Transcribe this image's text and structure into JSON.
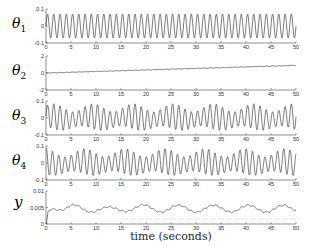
{
  "chart_data": [
    {
      "type": "line",
      "panel": "theta1",
      "ylabel": "θ1",
      "xlim": [
        0,
        50
      ],
      "ylim": [
        -0.1,
        0.1
      ],
      "yticks": [
        "-0.1",
        "0",
        "0.1"
      ],
      "xticks": [
        "0",
        "5",
        "10",
        "15",
        "20",
        "25",
        "30",
        "35",
        "40",
        "45",
        "50"
      ],
      "description": "steady sinusoidal oscillation, ~0.8 Hz, amplitude ~0.07",
      "x": [
        0,
        50
      ],
      "frequency_hz": 0.8,
      "amplitude": 0.07,
      "offset": 0.0
    },
    {
      "type": "line",
      "panel": "theta2",
      "ylabel": "θ2",
      "xlim": [
        0,
        50
      ],
      "ylim": [
        -2,
        2
      ],
      "yticks": [
        "-2",
        "0",
        "2"
      ],
      "xticks": [
        "0",
        "5",
        "10",
        "15",
        "20",
        "25",
        "30",
        "35",
        "40",
        "45",
        "50"
      ],
      "description": "slowly increasing nearly linear drift",
      "x": [
        0,
        10,
        20,
        30,
        40,
        50
      ],
      "y": [
        0.0,
        0.18,
        0.36,
        0.54,
        0.72,
        0.9
      ]
    },
    {
      "type": "line",
      "panel": "theta3",
      "ylabel": "θ3",
      "xlim": [
        0,
        50
      ],
      "ylim": [
        -0.1,
        0.1
      ],
      "yticks": [
        "-0.1",
        "0",
        "0.1"
      ],
      "xticks": [
        "0",
        "5",
        "10",
        "15",
        "20",
        "25",
        "30",
        "35",
        "40",
        "45",
        "50"
      ],
      "description": "oscillation ~0.8 Hz with slow amplitude modulation, amplitude ~0.05-0.07",
      "frequency_hz": 0.8,
      "amplitude": 0.06,
      "modulation_period_s": 8
    },
    {
      "type": "line",
      "panel": "theta4",
      "ylabel": "θ4",
      "xlim": [
        0,
        50
      ],
      "ylim": [
        -0.1,
        0.1
      ],
      "yticks": [
        "-0.1",
        "0",
        "0.1"
      ],
      "xticks": [
        "0",
        "5",
        "10",
        "15",
        "20",
        "25",
        "30",
        "35",
        "40",
        "45",
        "50"
      ],
      "description": "oscillation ~0.8 Hz with slow amplitude/offset modulation, amplitude ~0.05-0.07",
      "frequency_hz": 0.8,
      "amplitude": 0.06,
      "modulation_period_s": 8
    },
    {
      "type": "line",
      "panel": "y",
      "ylabel": "y",
      "xlabel": "time (seconds)",
      "xlim": [
        0,
        50
      ],
      "ylim": [
        0,
        0.01
      ],
      "yticks": [
        "0",
        "0.005",
        "0.01"
      ],
      "xticks": [
        "0",
        "5",
        "10",
        "15",
        "20",
        "25",
        "30",
        "35",
        "40",
        "45",
        "50"
      ],
      "description": "rises quickly from 0 to ~0.0045, then slow oscillation between ~0.0035 and ~0.006 with period ~7s; faint dotted reference line near 0.0015 from t=15 to 50",
      "x": [
        0,
        0.5,
        1,
        3,
        5.5,
        9,
        12.5,
        16,
        19.5,
        23,
        26.5,
        30,
        33.5,
        37,
        40.5,
        44,
        47.5,
        50
      ],
      "y": [
        0,
        0.004,
        0.0045,
        0.0042,
        0.0058,
        0.0036,
        0.0052,
        0.0038,
        0.0058,
        0.0036,
        0.0057,
        0.0036,
        0.0057,
        0.0036,
        0.0057,
        0.0036,
        0.0057,
        0.0042
      ],
      "reference_line": {
        "y": 0.0015,
        "x_start": 15,
        "x_end": 50,
        "style": "dotted"
      }
    }
  ],
  "labels": {
    "theta1": "θ",
    "theta1_sub": "1",
    "theta2": "θ",
    "theta2_sub": "2",
    "theta3": "θ",
    "theta3_sub": "3",
    "theta4": "θ",
    "theta4_sub": "4",
    "y": "y",
    "xlabel": "time (seconds)"
  }
}
